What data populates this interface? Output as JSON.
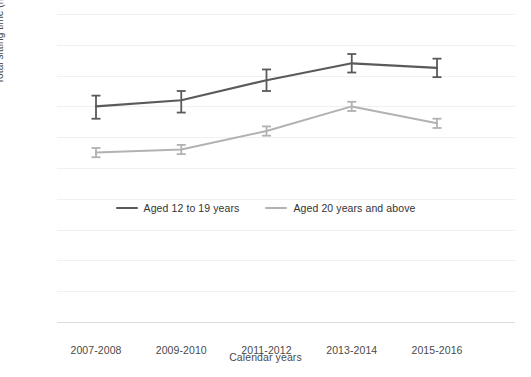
{
  "chart_data": {
    "type": "line",
    "title": "",
    "xlabel": "Calendar years",
    "ylabel": "Total sitting time (hours/day)",
    "categories": [
      "2007-2008",
      "2009-2010",
      "2011-2012",
      "2013-2014",
      "2015-2016"
    ],
    "ylim": [
      0,
      10
    ],
    "ytick_step": 1,
    "yticks": [
      "10",
      "9",
      "8",
      "7",
      "6",
      "5",
      "4",
      "3",
      "2",
      "1",
      "0"
    ],
    "grid": true,
    "legend_position": "center-inside",
    "series": [
      {
        "name": "Aged 12 to 19 years",
        "color": "#5a5a5a",
        "values": [
          7.0,
          7.2,
          7.85,
          8.4,
          8.25
        ],
        "error_low": [
          6.6,
          6.8,
          7.5,
          8.1,
          7.95
        ],
        "error_high": [
          7.35,
          7.5,
          8.2,
          8.7,
          8.55
        ]
      },
      {
        "name": "Aged 20 years and above",
        "color": "#b2b2b2",
        "values": [
          5.5,
          5.6,
          6.2,
          7.0,
          6.45
        ],
        "error_low": [
          5.35,
          5.45,
          6.05,
          6.85,
          6.3
        ],
        "error_high": [
          5.65,
          5.75,
          6.35,
          7.15,
          6.6
        ]
      }
    ]
  },
  "legend": {
    "entries": [
      {
        "label": "Aged 12 to 19 years",
        "color": "#5a5a5a"
      },
      {
        "label": "Aged 20 years and above",
        "color": "#b2b2b2"
      }
    ]
  },
  "header_fragments": [
    "",
    "",
    ""
  ]
}
